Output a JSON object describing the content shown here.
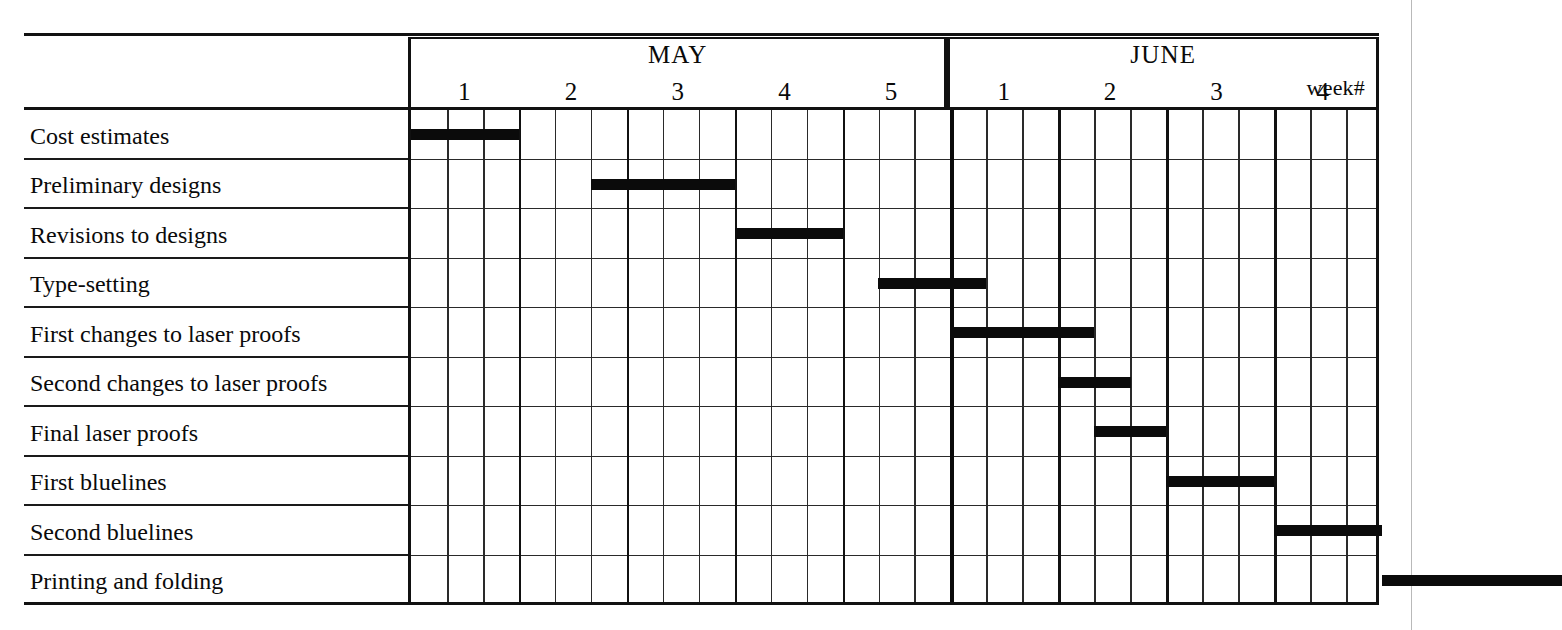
{
  "chart_data": {
    "type": "bar",
    "title": "",
    "xlabel": "",
    "ylabel": "",
    "chart_kind": "gantt",
    "week_label": "week#",
    "months": [
      {
        "name": "MAY",
        "weeks": [
          "1",
          "2",
          "3",
          "4",
          "5"
        ]
      },
      {
        "name": "JUNE",
        "weeks": [
          "1",
          "2",
          "3",
          "4"
        ]
      }
    ],
    "week_sequence": [
      "MAY 1",
      "MAY 2",
      "MAY 3",
      "MAY 4",
      "MAY 5",
      "JUNE 1",
      "JUNE 2",
      "JUNE 3",
      "JUNE 4"
    ],
    "subdivisions_per_week": 3,
    "total_weeks": 9,
    "bar_color": "#0b0b0b",
    "grid": true,
    "legend": "none",
    "categories": [
      "Cost estimates",
      "Preliminary designs",
      "Revisions to designs",
      "Type-setting",
      "First changes to laser proofs",
      "Second changes to laser proofs",
      "Final laser proofs",
      "First bluelines",
      "Second bluelines",
      "Printing and folding"
    ],
    "tasks": [
      {
        "name": "Cost estimates",
        "start_week": 0.0,
        "end_week": 1.0,
        "duration_weeks": 1.0
      },
      {
        "name": "Preliminary designs",
        "start_week": 1.67,
        "end_week": 3.0,
        "duration_weeks": 1.33
      },
      {
        "name": "Revisions to designs",
        "start_week": 3.0,
        "end_week": 4.0,
        "duration_weeks": 1.0
      },
      {
        "name": "Type-setting",
        "start_week": 4.33,
        "end_week": 5.33,
        "duration_weeks": 1.0
      },
      {
        "name": "First changes to laser proofs",
        "start_week": 5.0,
        "end_week": 6.33,
        "duration_weeks": 1.33
      },
      {
        "name": "Second changes to laser proofs",
        "start_week": 6.0,
        "end_week": 6.67,
        "duration_weeks": 0.67
      },
      {
        "name": "Final laser proofs",
        "start_week": 6.33,
        "end_week": 7.0,
        "duration_weeks": 0.67
      },
      {
        "name": "First bluelines",
        "start_week": 7.0,
        "end_week": 8.0,
        "duration_weeks": 1.0
      },
      {
        "name": "Second bluelines",
        "start_week": 8.0,
        "end_week": 9.0,
        "duration_weeks": 1.0
      },
      {
        "name": "Printing and folding",
        "start_week": 9.0,
        "end_week": 10.67,
        "duration_weeks": 1.67
      }
    ],
    "xlim": [
      0,
      9
    ],
    "units": "weeks"
  }
}
